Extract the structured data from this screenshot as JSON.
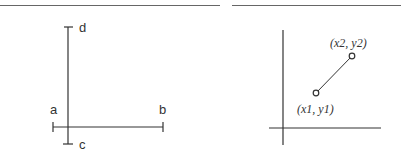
{
  "diagrams": [
    {
      "id": "left",
      "description": "Two perpendicular line segments with end caps",
      "labels": {
        "a": "a",
        "b": "b",
        "c": "c",
        "d": "d"
      }
    },
    {
      "id": "right",
      "description": "Coordinate axes with a line segment between two points",
      "labels": {
        "p1": "(x1, y1)",
        "p2": "(x2, y2)"
      }
    }
  ],
  "colors": {
    "line": "#333333",
    "rule": "#555555"
  }
}
